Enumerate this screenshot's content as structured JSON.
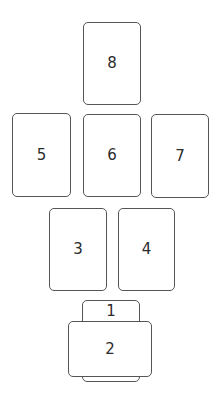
{
  "diagram": {
    "type": "card-spread",
    "card_count": 8,
    "border_color": "#555555",
    "text_color": "#2b2b2b",
    "background": "#ffffff",
    "cards": [
      {
        "id": "1",
        "label": "1",
        "orientation": "vertical",
        "position": "bottom-center, underneath card 2"
      },
      {
        "id": "2",
        "label": "2",
        "orientation": "horizontal",
        "position": "bottom-center, crossing card 1"
      },
      {
        "id": "3",
        "label": "3",
        "orientation": "vertical",
        "position": "row 3 left"
      },
      {
        "id": "4",
        "label": "4",
        "orientation": "vertical",
        "position": "row 3 right"
      },
      {
        "id": "5",
        "label": "5",
        "orientation": "vertical",
        "position": "row 2 left"
      },
      {
        "id": "6",
        "label": "6",
        "orientation": "vertical",
        "position": "row 2 center"
      },
      {
        "id": "7",
        "label": "7",
        "orientation": "vertical",
        "position": "row 2 right"
      },
      {
        "id": "8",
        "label": "8",
        "orientation": "vertical",
        "position": "top center"
      }
    ]
  },
  "labels": {
    "c1": "1",
    "c2": "2",
    "c3": "3",
    "c4": "4",
    "c5": "5",
    "c6": "6",
    "c7": "7",
    "c8": "8"
  }
}
